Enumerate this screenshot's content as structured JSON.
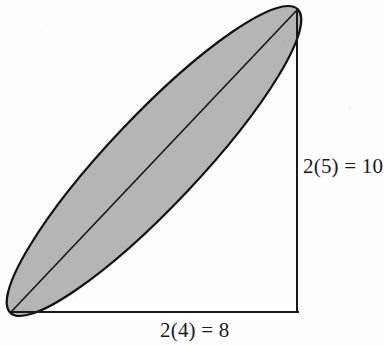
{
  "figure": {
    "kind": "geometry-diagram",
    "background_color": "#fdfdfd",
    "line_color": "#1a1a1a",
    "ellipse_fill_color": "#b5b5b5",
    "ellipse_stroke_color": "#111111",
    "text_color": "#1a1a1a",
    "labels": {
      "vertical_leg": "2(5) = 10",
      "horizontal_leg": "2(4) = 8"
    },
    "geometry": {
      "right_angle_vertex": {
        "x": 297,
        "y": 312
      },
      "horizontal_leg_start": {
        "x": 11,
        "y": 312
      },
      "vertical_leg_start": {
        "x": 297,
        "y": 10
      },
      "hypotenuse_start": {
        "x": 11,
        "y": 312
      },
      "hypotenuse_end": {
        "x": 297,
        "y": 10
      },
      "ellipse_center": {
        "x": 154,
        "y": 161
      },
      "ellipse_semi_major": 209,
      "ellipse_semi_minor": 45,
      "ellipse_rotation_degrees": -46.6
    }
  },
  "chart_data": {
    "type": "diagram",
    "title": "",
    "xlabel": "2(4) = 8",
    "ylabel": "2(5) = 10",
    "annotations": [
      "2(5) = 10",
      "2(4) = 8"
    ],
    "shapes": [
      {
        "name": "right-triangle",
        "type": "polyline",
        "points": [
          [
            11,
            312
          ],
          [
            297,
            312
          ],
          [
            297,
            10
          ],
          [
            11,
            312
          ]
        ],
        "stroke": "#1a1a1a",
        "fill": "none"
      },
      {
        "name": "shaded-ellipse",
        "type": "ellipse",
        "center": [
          154,
          161
        ],
        "semi_major": 209,
        "semi_minor": 45,
        "rotation_degrees": -46.6,
        "stroke": "#111111",
        "fill": "#b5b5b5"
      },
      {
        "name": "hypotenuse-major-axis",
        "type": "line",
        "points": [
          [
            11,
            312
          ],
          [
            297,
            10
          ]
        ],
        "stroke": "#1a1a1a",
        "fill": "none"
      }
    ],
    "measurements": [
      {
        "name": "horizontal_leg",
        "label": "2(4) = 8",
        "value": 8,
        "expression": "2(4)",
        "factor": 2,
        "base": 4
      },
      {
        "name": "vertical_leg",
        "label": "2(5) = 10",
        "value": 10,
        "expression": "2(5)",
        "factor": 2,
        "base": 5
      }
    ]
  }
}
